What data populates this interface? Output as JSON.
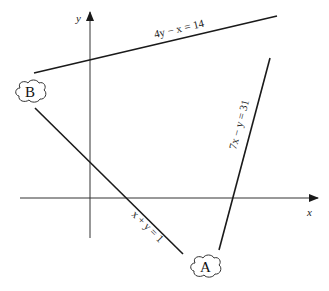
{
  "diagram": {
    "axes": {
      "x_label": "x",
      "y_label": "y"
    },
    "lines": [
      {
        "id": "line-1",
        "equation": "4y − x = 14",
        "color": "#1a1a1a"
      },
      {
        "id": "line-2",
        "equation": "x + y = 1",
        "color": "#1a1a1a"
      },
      {
        "id": "line-3",
        "equation": "7x − y = 31",
        "color": "#1a1a1a"
      }
    ],
    "points": [
      {
        "id": "point-b",
        "label": "B"
      },
      {
        "id": "point-a",
        "label": "A"
      }
    ]
  }
}
